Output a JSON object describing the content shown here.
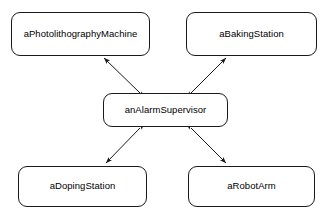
{
  "diagram": {
    "type": "object-collaboration-diagram",
    "background_color": "#ffffff",
    "line_color": "#1a1a1a",
    "text_color": "#000000",
    "nodes": [
      {
        "id": "photolithography",
        "label": "aPhotolithographyMachine",
        "x": 11,
        "y": 12,
        "width": 139,
        "height": 44
      },
      {
        "id": "baking",
        "label": "aBakingStation",
        "x": 186,
        "y": 12,
        "width": 131,
        "height": 44
      },
      {
        "id": "supervisor",
        "label": "anAlarmSupervisor",
        "x": 103,
        "y": 93,
        "width": 125,
        "height": 34
      },
      {
        "id": "doping",
        "label": "aDopingStation",
        "x": 18,
        "y": 166,
        "width": 129,
        "height": 41
      },
      {
        "id": "robot",
        "label": "aRobotArm",
        "x": 188,
        "y": 166,
        "width": 127,
        "height": 41
      }
    ],
    "edges": [
      {
        "id": "supervisor-photolithography",
        "from": "anAlarmSupervisor",
        "to": "aPhotolithographyMachine",
        "direction": "bidirectional",
        "x1": 140,
        "y1": 93,
        "x2": 104,
        "y2": 58
      },
      {
        "id": "supervisor-baking",
        "from": "anAlarmSupervisor",
        "to": "aBakingStation",
        "direction": "bidirectional",
        "x1": 191,
        "y1": 93,
        "x2": 226,
        "y2": 58
      },
      {
        "id": "supervisor-doping",
        "from": "anAlarmSupervisor",
        "to": "aDopingStation",
        "direction": "bidirectional",
        "x1": 140,
        "y1": 128,
        "x2": 106,
        "y2": 163
      },
      {
        "id": "supervisor-robot",
        "from": "anAlarmSupervisor",
        "to": "aRobotArm",
        "direction": "bidirectional",
        "x1": 191,
        "y1": 128,
        "x2": 226,
        "y2": 163
      }
    ]
  }
}
